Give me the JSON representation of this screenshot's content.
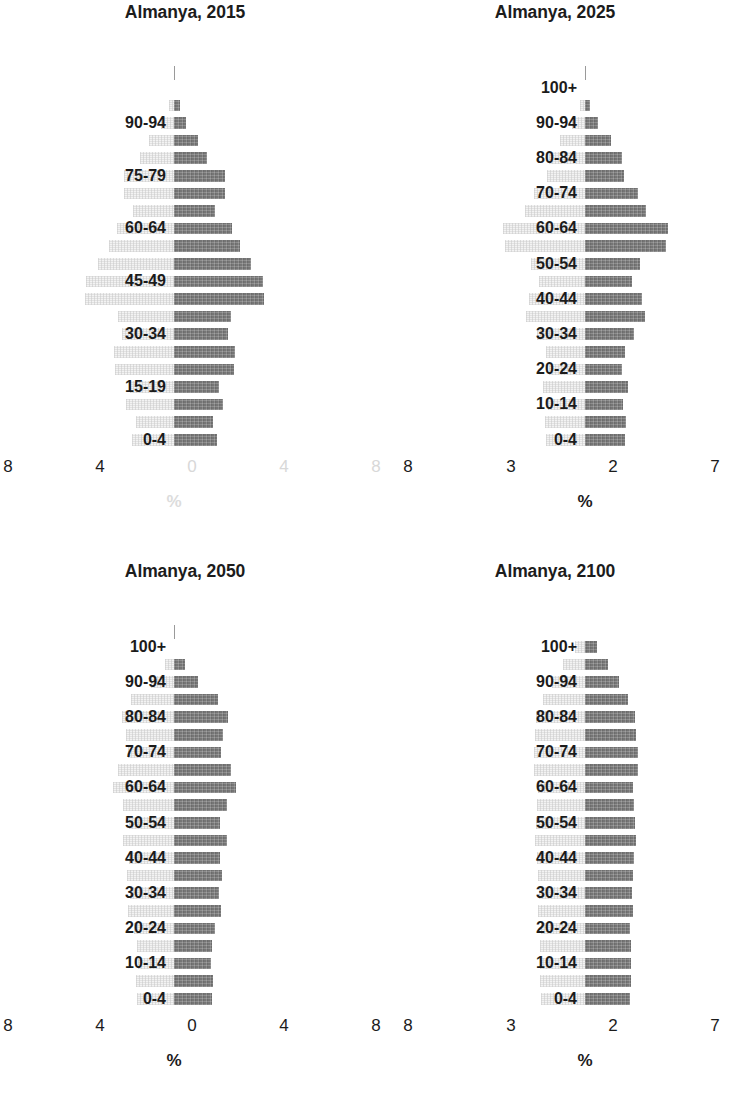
{
  "figure": {
    "title_prefix": "Almanya",
    "bar_color": "#7e7e7e",
    "ghost_color": "#f0f0f0",
    "background": "#ffffff"
  },
  "chart_data": [
    {
      "type": "bar",
      "title": "Almanya, 2015",
      "xlabel": "%",
      "ylabel": "",
      "orientation": "horizontal",
      "subtype": "population-pyramid",
      "grid": false,
      "legend": null,
      "xlim": [
        8,
        8
      ],
      "axis_tick_labels": [
        "8",
        "4",
        "0",
        "4",
        "8"
      ],
      "axis_tick_faded": [
        false,
        false,
        true,
        true,
        true
      ],
      "axis_title_faded": true,
      "max_value": 4.3,
      "top_tick_visible": true,
      "top_label_visible": false,
      "categories": [
        "100+",
        "95-99",
        "90-94",
        "85-89",
        "80-84",
        "75-79",
        "70-74",
        "65-69",
        "60-64",
        "55-59",
        "50-54",
        "45-49",
        "40-44",
        "35-39",
        "30-34",
        "25-29",
        "20-24",
        "15-19",
        "10-14",
        "5-9",
        "0-4"
      ],
      "visible_category_labels": [
        "90-94",
        "75-79",
        "60-64",
        "45-49",
        "30-34",
        "15-19",
        "0-4"
      ],
      "values": [
        0.0,
        0.0,
        0.55,
        1.15,
        1.55,
        2.45,
        2.45,
        1.95,
        2.75,
        3.15,
        3.65,
        4.25,
        4.3,
        2.7,
        2.55,
        2.9,
        2.85,
        2.15,
        2.35,
        1.85,
        2.05,
        2.1
      ],
      "series": [
        {
          "name": "Erkek",
          "side": "right",
          "values": [
            0.0,
            0.3,
            0.55,
            1.15,
            1.55,
            2.45,
            2.45,
            1.95,
            2.75,
            3.15,
            3.65,
            4.25,
            4.3,
            2.7,
            2.55,
            2.9,
            2.85,
            2.15,
            2.35,
            1.85,
            2.05
          ]
        },
        {
          "name": "Kadin",
          "side": "left",
          "values": [
            0.0,
            0.25,
            0.6,
            1.2,
            1.6,
            2.4,
            2.4,
            1.95,
            2.7,
            3.1,
            3.6,
            4.2,
            4.25,
            2.65,
            2.5,
            2.85,
            2.8,
            2.1,
            2.3,
            1.8,
            2.0
          ]
        }
      ]
    },
    {
      "type": "bar",
      "title": "Almanya, 2025",
      "xlabel": "%",
      "ylabel": "",
      "orientation": "horizontal",
      "subtype": "population-pyramid",
      "grid": false,
      "legend": null,
      "xlim": [
        3,
        7
      ],
      "axis_tick_labels": [
        "8",
        "3",
        "2",
        "7"
      ],
      "axis_tick_faded": [
        false,
        false,
        false,
        false
      ],
      "axis_title_faded": false,
      "max_value": 4.2,
      "top_tick_visible": true,
      "top_label_visible": true,
      "categories": [
        "100+",
        "95-99",
        "90-94",
        "85-89",
        "80-84",
        "75-79",
        "70-74",
        "65-69",
        "60-64",
        "55-59",
        "50-54",
        "45-49",
        "40-44",
        "35-39",
        "30-34",
        "25-29",
        "20-24",
        "15-19",
        "10-14",
        "5-9",
        "0-4"
      ],
      "visible_category_labels": [
        "100+",
        "90-94",
        "80-84",
        "70-74",
        "60-64",
        "50-54",
        "40-44",
        "30-34",
        "20-24",
        "10-14",
        "0-4"
      ],
      "values": [
        0.0,
        0.0,
        0.6,
        1.25,
        1.75,
        1.85,
        2.5,
        2.9,
        3.95,
        3.85,
        2.6,
        2.25,
        2.7,
        2.85,
        2.35,
        1.9,
        1.75,
        2.05,
        1.8,
        1.95,
        1.9
      ],
      "series": [
        {
          "name": "Erkek",
          "side": "right",
          "values": [
            0.0,
            0.25,
            0.6,
            1.25,
            1.75,
            1.85,
            2.5,
            2.9,
            3.95,
            3.85,
            2.6,
            2.25,
            2.7,
            2.85,
            2.35,
            1.9,
            1.75,
            2.05,
            1.8,
            1.95,
            1.9
          ]
        },
        {
          "name": "Kadin",
          "side": "left",
          "values": [
            0.0,
            0.25,
            0.6,
            1.2,
            1.7,
            1.8,
            2.45,
            2.85,
            3.9,
            3.8,
            2.55,
            2.2,
            2.65,
            2.8,
            2.3,
            1.85,
            1.7,
            2.0,
            1.75,
            1.9,
            1.85
          ]
        }
      ]
    },
    {
      "type": "bar",
      "title": "Almanya, 2050",
      "xlabel": "%",
      "ylabel": "",
      "orientation": "horizontal",
      "subtype": "population-pyramid",
      "grid": false,
      "legend": null,
      "xlim": [
        8,
        8
      ],
      "axis_tick_labels": [
        "8",
        "4",
        "0",
        "4",
        "8"
      ],
      "axis_tick_faded": [
        false,
        false,
        false,
        false,
        false
      ],
      "axis_title_faded": false,
      "max_value": 3.45,
      "top_tick_visible": true,
      "top_label_visible": true,
      "categories": [
        "100+",
        "95-99",
        "90-94",
        "85-89",
        "80-84",
        "75-79",
        "70-74",
        "65-69",
        "60-64",
        "55-59",
        "50-54",
        "45-49",
        "40-44",
        "35-39",
        "30-34",
        "25-29",
        "20-24",
        "15-19",
        "10-14",
        "5-9",
        "0-4"
      ],
      "visible_category_labels": [
        "100+",
        "90-94",
        "80-84",
        "70-74",
        "60-64",
        "50-54",
        "40-44",
        "30-34",
        "20-24",
        "10-14",
        "0-4"
      ],
      "values": [
        0.0,
        0.5,
        1.15,
        2.1,
        2.55,
        2.35,
        2.25,
        2.7,
        2.95,
        2.5,
        2.2,
        2.5,
        2.2,
        2.3,
        2.15,
        2.25,
        1.95,
        1.8,
        1.75,
        1.85,
        1.8
      ],
      "series": [
        {
          "name": "Erkek",
          "side": "right",
          "values": [
            0.0,
            0.5,
            1.15,
            2.1,
            2.55,
            2.35,
            2.25,
            2.7,
            2.95,
            2.5,
            2.2,
            2.5,
            2.2,
            2.3,
            2.15,
            2.25,
            1.95,
            1.8,
            1.75,
            1.85,
            1.8
          ]
        },
        {
          "name": "Kadin",
          "side": "left",
          "values": [
            0.0,
            0.45,
            1.1,
            2.05,
            2.5,
            2.3,
            2.2,
            2.65,
            2.9,
            2.45,
            2.15,
            2.45,
            2.15,
            2.25,
            2.1,
            2.2,
            1.9,
            1.75,
            1.7,
            1.8,
            1.75
          ]
        }
      ]
    },
    {
      "type": "bar",
      "title": "Almanya, 2100",
      "xlabel": "%",
      "ylabel": "",
      "orientation": "horizontal",
      "subtype": "population-pyramid",
      "grid": false,
      "legend": null,
      "xlim": [
        3,
        7
      ],
      "axis_tick_labels": [
        "8",
        "3",
        "2",
        "7"
      ],
      "axis_tick_faded": [
        false,
        false,
        false,
        false
      ],
      "axis_title_faded": false,
      "max_value": 2.55,
      "top_tick_visible": false,
      "top_label_visible": true,
      "categories": [
        "100+",
        "95-99",
        "90-94",
        "85-89",
        "80-84",
        "75-79",
        "70-74",
        "65-69",
        "60-64",
        "55-59",
        "50-54",
        "45-49",
        "40-44",
        "35-39",
        "30-34",
        "25-29",
        "20-24",
        "15-19",
        "10-14",
        "5-9",
        "0-4"
      ],
      "visible_category_labels": [
        "100+",
        "90-94",
        "80-84",
        "70-74",
        "60-64",
        "50-54",
        "40-44",
        "30-34",
        "20-24",
        "10-14",
        "0-4"
      ],
      "values": [
        0.55,
        1.1,
        1.6,
        2.05,
        2.4,
        2.45,
        2.5,
        2.5,
        2.3,
        2.35,
        2.4,
        2.45,
        2.35,
        2.3,
        2.25,
        2.3,
        2.15,
        2.2,
        2.2,
        2.2,
        2.15
      ],
      "series": [
        {
          "name": "Erkek",
          "side": "right",
          "values": [
            0.55,
            1.1,
            1.6,
            2.05,
            2.4,
            2.45,
            2.5,
            2.5,
            2.3,
            2.35,
            2.4,
            2.45,
            2.35,
            2.3,
            2.25,
            2.3,
            2.15,
            2.2,
            2.2,
            2.2,
            2.15
          ]
        },
        {
          "name": "Kadin",
          "side": "left",
          "values": [
            0.5,
            1.05,
            1.55,
            2.0,
            2.35,
            2.4,
            2.45,
            2.45,
            2.25,
            2.3,
            2.35,
            2.4,
            2.3,
            2.25,
            2.2,
            2.25,
            2.1,
            2.15,
            2.15,
            2.15,
            2.1
          ]
        }
      ]
    }
  ]
}
